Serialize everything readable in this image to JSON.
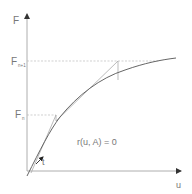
{
  "diagram": {
    "type": "newton-raphson-load-displacement",
    "labels": {
      "y_axis": "F",
      "x_axis": "u",
      "f_n1_main": "F",
      "f_n1_sub": "n+1",
      "f_n_main": "F",
      "f_n_sub": "n",
      "tangent": "t",
      "equation": "r(u, A) = 0"
    },
    "colors": {
      "axis": "#888888",
      "curve": "#666666",
      "tangent": "#aaaaaa",
      "dashed": "#bbbbbb",
      "text": "#777777"
    }
  }
}
